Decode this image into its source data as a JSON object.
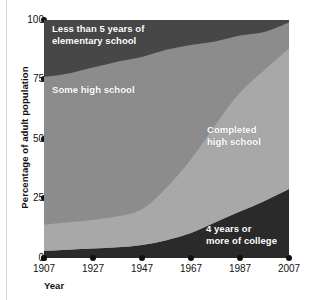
{
  "chart_data": {
    "type": "area",
    "stacked": true,
    "title": "",
    "xlabel": "Year",
    "ylabel": "Percentage of adult population",
    "x": [
      1907,
      1917,
      1927,
      1937,
      1947,
      1957,
      1967,
      1977,
      1987,
      1997,
      2007
    ],
    "xticks": [
      "1907",
      "1927",
      "1947",
      "1967",
      "1987",
      "2007"
    ],
    "yticks": [
      "0",
      "25",
      "50",
      "75",
      "100"
    ],
    "ylim": [
      0,
      100
    ],
    "xlim": [
      1907,
      2007
    ],
    "grid": false,
    "legend_position": "inline-labels",
    "series": [
      {
        "name": "4 years or more of college",
        "color": "#2a2a2a",
        "values": [
          3,
          3.5,
          4,
          4.5,
          5.5,
          7.5,
          10.5,
          15,
          19.5,
          24,
          29
        ]
      },
      {
        "name": "Completed high school",
        "color": "#a8a8a8",
        "values": [
          11,
          11.5,
          12,
          13,
          15,
          22,
          31,
          41,
          50,
          55,
          59
        ]
      },
      {
        "name": "Some high school",
        "color": "#8c8c8c",
        "values": [
          62,
          62.5,
          64,
          65,
          64,
          58,
          48,
          35,
          24,
          16,
          11
        ]
      },
      {
        "name": "Less than 5 years of elementary school",
        "color": "#474747",
        "values": [
          24,
          22.5,
          20,
          17.5,
          15.5,
          12.5,
          10.5,
          9,
          6.5,
          5,
          1
        ]
      }
    ]
  },
  "axes": {
    "y_title": "Percentage of adult population",
    "x_title": "Year",
    "y_tick_labels": [
      "100",
      "75",
      "50",
      "25",
      "0"
    ],
    "x_tick_labels": [
      "1907",
      "1927",
      "1947",
      "1967",
      "1987",
      "2007"
    ]
  },
  "series_labels": {
    "elementary": "Less than 5 years of\nelementary school",
    "some_high_school": "Some high school",
    "completed_high_school": "Completed\nhigh school",
    "college": "4 years or\nmore of college"
  },
  "colors": {
    "band_elementary": "#474747",
    "band_some_high_school": "#8c8c8c",
    "band_completed_high_school": "#a8a8a8",
    "band_college": "#2a2a2a",
    "axis": "#111111",
    "label_text": "#ffffff",
    "background": "#ffffff"
  }
}
